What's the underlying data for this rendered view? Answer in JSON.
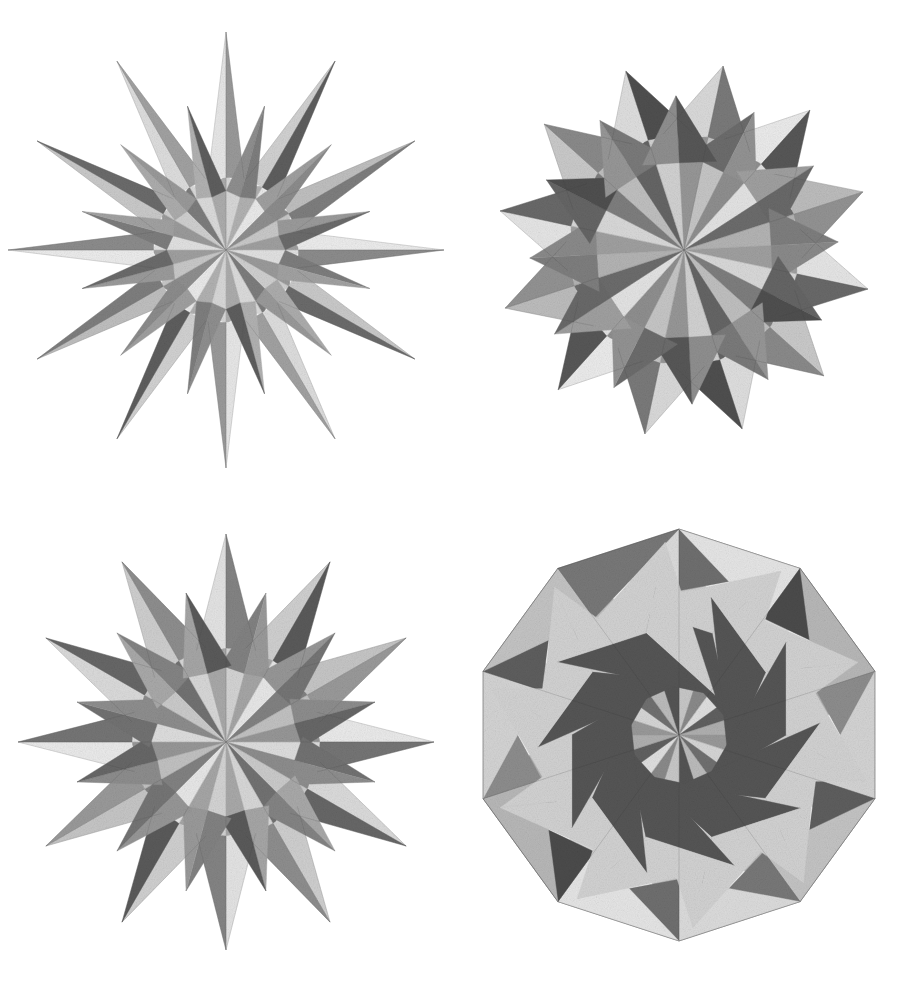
{
  "plate": {
    "background_color": "#ffffff",
    "ink_color": "#2b2b2b",
    "medium": "stipple lithograph engraving",
    "layout": "2x2 grid of polyhedron illustrations",
    "width": 906,
    "height": 990
  },
  "figures": [
    {
      "id": "great-stellated-dodecahedron",
      "position": "top-left",
      "name": "Great stellated dodecahedron",
      "spike_count": 12,
      "silhouette": "twelve long slender star points radiating from a central core",
      "center": [
        226,
        250
      ],
      "bounding_box": [
        18,
        24,
        430,
        460
      ],
      "core_radius": 74,
      "spike_radius": 218,
      "spike_half_width_deg": 14,
      "rotation_deg": -90,
      "tones": {
        "lightest": "#f0f0f0",
        "light": "#dcdcdc",
        "mid_light": "#c4c4c4",
        "mid": "#a8a8a8",
        "mid_dark": "#8a8a8a",
        "dark": "#6a6a6a",
        "darkest": "#474747"
      },
      "facet_shades": [
        "#e8e8e8",
        "#9a9a9a",
        "#d2d2d2",
        "#5e5e5e",
        "#c0c0c0",
        "#7e7e7e",
        "#ededed",
        "#8c8c8c",
        "#cacaca",
        "#6b6b6b",
        "#dedede",
        "#a2a2a2"
      ],
      "core_shades": [
        "#d8d8d8",
        "#b2b2b2",
        "#ebebeb",
        "#8f8f8f",
        "#c9c9c9",
        "#a0a0a0",
        "#e2e2e2",
        "#9b9b9b",
        "#d0d0d0",
        "#7d7d7d",
        "#dcdcdc",
        "#adadad"
      ]
    },
    {
      "id": "small-stellated-dodecahedron",
      "position": "top-right",
      "name": "Small stellated dodecahedron",
      "spike_count": 12,
      "silhouette": "twelve short broad pyramidal points on a dense compact body",
      "center": [
        231,
        250
      ],
      "bounding_box": [
        478,
        80,
        890,
        700
      ],
      "core_radius": 118,
      "spike_radius": 188,
      "spike_half_width_deg": 22,
      "rotation_deg": -78,
      "tones": {
        "lightest": "#ededed",
        "light": "#d6d6d6",
        "mid_light": "#bdbdbd",
        "mid": "#9e9e9e",
        "mid_dark": "#818181",
        "dark": "#606060",
        "darkest": "#3e3e3e"
      },
      "facet_shades": [
        "#dadada",
        "#7a7a7a",
        "#ececec",
        "#575757",
        "#bdbdbd",
        "#939393",
        "#e6e6e6",
        "#696969",
        "#cacaca",
        "#8a8a8a",
        "#dfdfdf",
        "#4f4f4f"
      ],
      "core_shades": [
        "#c6c6c6",
        "#8f8f8f",
        "#e4e4e4",
        "#6c6c6c",
        "#b4b4b4",
        "#a0a0a0",
        "#d9d9d9",
        "#7e7e7e",
        "#c0c0c0",
        "#656565",
        "#d2d2d2",
        "#979797"
      ]
    },
    {
      "id": "great-icosahedron",
      "position": "bottom-left",
      "name": "Great icosahedron",
      "spike_count": 12,
      "silhouette": "twelve medium star points with visible nested triangular facets",
      "center": [
        226,
        247
      ],
      "bounding_box": [
        14,
        560,
        436,
        960
      ],
      "core_radius": 96,
      "spike_radius": 208,
      "spike_half_width_deg": 18,
      "rotation_deg": -90,
      "tones": {
        "lightest": "#efefef",
        "light": "#d9d9d9",
        "mid_light": "#c0c0c0",
        "mid": "#a3a3a3",
        "mid_dark": "#858585",
        "dark": "#636363",
        "darkest": "#414141"
      },
      "facet_shades": [
        "#e4e4e4",
        "#848484",
        "#d0d0d0",
        "#5a5a5a",
        "#c6c6c6",
        "#9a9a9a",
        "#ebebeb",
        "#757575",
        "#dbdbdb",
        "#676767",
        "#cfcfcf",
        "#8e8e8e"
      ],
      "core_shades": [
        "#d4d4d4",
        "#a6a6a6",
        "#e8e8e8",
        "#828282",
        "#c2c2c2",
        "#979797",
        "#dedede",
        "#8d8d8d",
        "#cbcbcb",
        "#727272",
        "#d8d8d8",
        "#a9a9a9"
      ]
    },
    {
      "id": "great-dodecahedron",
      "position": "bottom-right",
      "name": "Great dodecahedron",
      "spike_count": 10,
      "silhouette": "convex icosahedral outline with recessed pentagrammic dimples",
      "center": [
        226,
        240
      ],
      "bounding_box": [
        472,
        558,
        898,
        948
      ],
      "core_radius": 206,
      "spike_radius": 206,
      "spike_half_width_deg": 36,
      "rotation_deg": -90,
      "tones": {
        "lightest": "#eaeaea",
        "light": "#d2d2d2",
        "mid_light": "#b5b5b5",
        "mid": "#969696",
        "mid_dark": "#767676",
        "dark": "#555555",
        "darkest": "#333333"
      },
      "facet_shades": [
        "#dcdcdc",
        "#6f6f6f",
        "#e6e6e6",
        "#4b4b4b",
        "#b8b8b8",
        "#8d8d8d",
        "#d4d4d4",
        "#5e5e5e",
        "#c4c4c4",
        "#787878"
      ],
      "core_shades": [
        "#c8c8c8",
        "#8a8a8a",
        "#e0e0e0",
        "#606060",
        "#b0b0b0",
        "#999999",
        "#d6d6d6",
        "#707070",
        "#bcbcbc",
        "#545454"
      ]
    }
  ]
}
